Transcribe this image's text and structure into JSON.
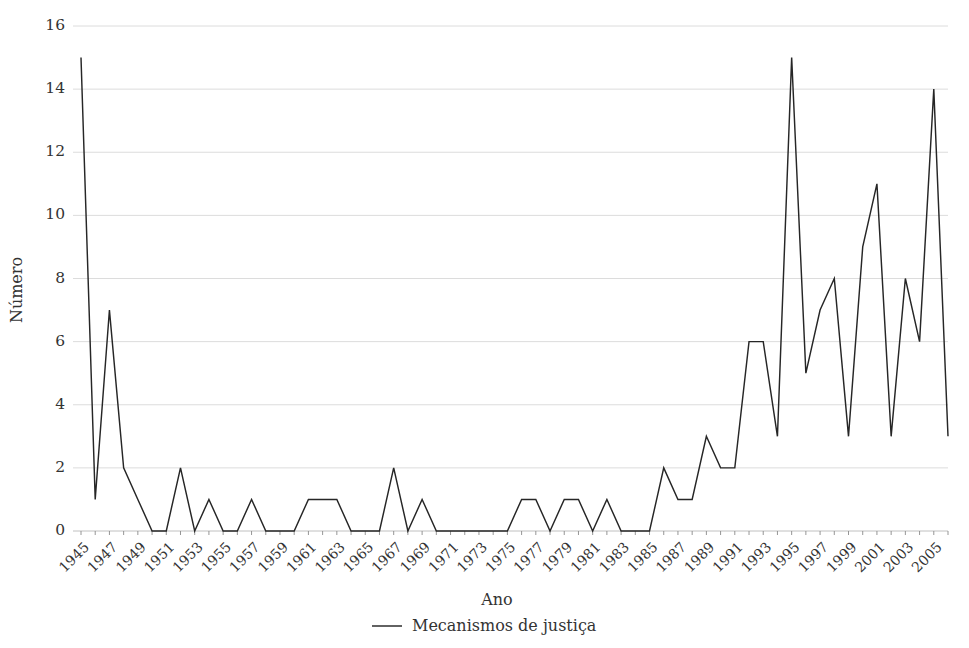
{
  "chart_data": {
    "type": "line",
    "title": "",
    "xlabel": "Ano",
    "ylabel": "Número",
    "ylim": [
      0,
      16
    ],
    "ytick_values": [
      0,
      2,
      4,
      6,
      8,
      10,
      12,
      14,
      16
    ],
    "ytick_labels": [
      "0",
      "2",
      "4",
      "6",
      "8",
      "10",
      "12",
      "14",
      "16"
    ],
    "xlim": [
      1945,
      2006
    ],
    "xtick_labels": [
      "1945",
      "1947",
      "1949",
      "1951",
      "1953",
      "1955",
      "1957",
      "1959",
      "1961",
      "1963",
      "1965",
      "1967",
      "1969",
      "1971",
      "1973",
      "1975",
      "1977",
      "1979",
      "1981",
      "1983",
      "1985",
      "1987",
      "1989",
      "1991",
      "1993",
      "1995",
      "1997",
      "1999",
      "2001",
      "2003",
      "2005"
    ],
    "grid": true,
    "legend_position": "bottom-center",
    "legend": [
      "Mecanismos de justiça"
    ],
    "series": [
      {
        "name": "Mecanismos de justiça",
        "color": "#262626",
        "x": [
          1945,
          1946,
          1947,
          1948,
          1949,
          1950,
          1951,
          1952,
          1953,
          1954,
          1955,
          1956,
          1957,
          1958,
          1959,
          1960,
          1961,
          1962,
          1963,
          1964,
          1965,
          1966,
          1967,
          1968,
          1969,
          1970,
          1971,
          1972,
          1973,
          1974,
          1975,
          1976,
          1977,
          1978,
          1979,
          1980,
          1981,
          1982,
          1983,
          1984,
          1985,
          1986,
          1987,
          1988,
          1989,
          1990,
          1991,
          1992,
          1993,
          1994,
          1995,
          1996,
          1997,
          1998,
          1999,
          2000,
          2001,
          2002,
          2003,
          2004,
          2005,
          2006
        ],
        "values": [
          15,
          1,
          7,
          2,
          1,
          0,
          0,
          2,
          0,
          1,
          0,
          0,
          1,
          0,
          0,
          0,
          1,
          1,
          1,
          0,
          0,
          0,
          2,
          0,
          1,
          0,
          0,
          0,
          0,
          0,
          0,
          1,
          1,
          0,
          1,
          1,
          0,
          1,
          0,
          0,
          0,
          2,
          1,
          1,
          3,
          2,
          2,
          6,
          6,
          3,
          15,
          5,
          7,
          8,
          3,
          9,
          11,
          3,
          8,
          6,
          14,
          3
        ]
      }
    ]
  },
  "colors": {
    "line": "#262626",
    "grid": "#d8d8d8",
    "axis": "#b9b9b9",
    "text": "#333333",
    "background": "#ffffff"
  }
}
